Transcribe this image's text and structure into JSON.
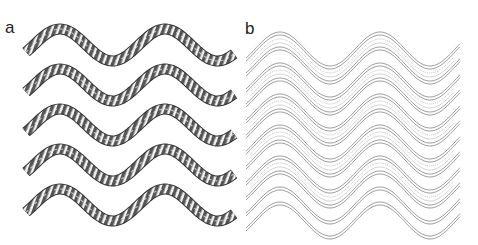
{
  "figure": {
    "panels": [
      {
        "label": "a",
        "description": "five wavy helical ribbons with shaded segments",
        "rows": 5
      },
      {
        "label": "b",
        "description": "six wavy outlined tubes with internal line structure",
        "rows": 6
      }
    ]
  }
}
